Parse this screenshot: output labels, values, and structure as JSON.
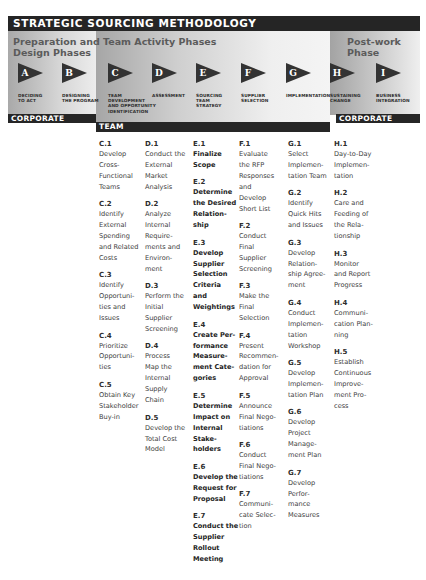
{
  "title": "STRATEGIC SOURCING METHODOLOGY",
  "colors": {
    "dark_bar": "#262626",
    "arrow": "#333333",
    "phase_title": "#5b5b5b",
    "panel_light": "#ececec",
    "panel_dark": "#a8a8a8"
  },
  "phases": {
    "preparation": {
      "title_line1": "Preparation and",
      "title_line2": "Design Phases",
      "bar_label": "CORPORATE"
    },
    "team": {
      "title": "Team Activity Phases",
      "bar_label": "TEAM"
    },
    "post": {
      "title_line1": "Post-work",
      "title_line2": "Phase",
      "bar_label": "CORPORATE"
    }
  },
  "steps": [
    {
      "letter": "A",
      "label_lines": [
        "Deciding",
        "to Act"
      ]
    },
    {
      "letter": "B",
      "label_lines": [
        "Designing",
        "the Program"
      ]
    },
    {
      "letter": "C",
      "label_lines": [
        "Team",
        "Development",
        "and Opportunity",
        "Identification"
      ]
    },
    {
      "letter": "D",
      "label_lines": [
        "Assessment"
      ]
    },
    {
      "letter": "E",
      "label_lines": [
        "Sourcing",
        "Team",
        "Strategy"
      ]
    },
    {
      "letter": "F",
      "label_lines": [
        "Supplier",
        "Selection"
      ]
    },
    {
      "letter": "G",
      "label_lines": [
        "Implementation"
      ]
    },
    {
      "letter": "H",
      "label_lines": [
        "Sustaining",
        "Change"
      ]
    },
    {
      "letter": "I",
      "label_lines": [
        "Business",
        "Integration"
      ]
    }
  ],
  "columns": {
    "C": [
      {
        "code": "C.1",
        "text": "Develop\nCross-\nFunctional\nTeams"
      },
      {
        "code": "C.2",
        "text": "Identify\nExternal\nSpending\nand Related\nCosts"
      },
      {
        "code": "C.3",
        "text": "Identify\nOpportuni-\nties and\nIssues"
      },
      {
        "code": "C.4",
        "text": "Prioritize\nOpportuni-\nties"
      },
      {
        "code": "C.5",
        "text": "Obtain Key\nStakeholder\nBuy-in"
      }
    ],
    "D": [
      {
        "code": "D.1",
        "text": "Conduct the\nExternal\nMarket\nAnalysis"
      },
      {
        "code": "D.2",
        "text": "Analyze\nInternal\nRequire-\nments and\nEnviron-\nment"
      },
      {
        "code": "D.3",
        "text": "Perform the\nInitial\nSupplier\nScreening"
      },
      {
        "code": "D.4",
        "text": "Process\nMap the\nInternal\nSupply\nChain"
      },
      {
        "code": "D.5",
        "text": "Develop the\nTotal Cost\nModel"
      }
    ],
    "E": [
      {
        "code": "E.1",
        "text": "Finalize\nScope"
      },
      {
        "code": "E.2",
        "text": "Determine\nthe Desired\nRelation-\nship"
      },
      {
        "code": "E.3",
        "text": "Develop\nSupplier\nSelection\nCriteria\nand\nWeightings"
      },
      {
        "code": "E.4",
        "text": "Create Per-\nformance\nMeasure-\nment Cate-\ngories"
      },
      {
        "code": "E.5",
        "text": "Determine\nImpact on\nInternal\nStake-\nholders"
      },
      {
        "code": "E.6",
        "text": "Develop the\nRequest for\nProposal"
      },
      {
        "code": "E.7",
        "text": "Conduct the\nSupplier\nRollout\nMeeting"
      }
    ],
    "F": [
      {
        "code": "F.1",
        "text": "Evaluate\nthe RFP\nResponses\nand\nDevelop\nShort List"
      },
      {
        "code": "F.2",
        "text": "Conduct\nFinal\nSupplier\nScreening"
      },
      {
        "code": "F.3",
        "text": "Make the\nFinal\nSelection"
      },
      {
        "code": "F.4",
        "text": "Present\nRecommen-\ndation for\nApproval"
      },
      {
        "code": "F.5",
        "text": "Announce\nFinal Nego-\ntiations"
      },
      {
        "code": "F.6",
        "text": "Conduct\nFinal Nego-\ntiations"
      },
      {
        "code": "F.7",
        "text": "Communi-\ncate Selec-\ntion"
      }
    ],
    "G": [
      {
        "code": "G.1",
        "text": "Select\nImplemen-\ntation Team"
      },
      {
        "code": "G.2",
        "text": "Identify\nQuick Hits\nand Issues"
      },
      {
        "code": "G.3",
        "text": "Develop\nRelation-\nship Agree-\nment"
      },
      {
        "code": "G.4",
        "text": "Conduct\nImplemen-\ntation\nWorkshop"
      },
      {
        "code": "G.5",
        "text": "Develop\nImplemen-\ntation Plan"
      },
      {
        "code": "G.6",
        "text": "Develop\nProject\nManage-\nment Plan"
      },
      {
        "code": "G.7",
        "text": "Develop\nPerfor-\nmance\nMeasures"
      }
    ],
    "H": [
      {
        "code": "H.1",
        "text": "Day-to-Day\nImplemen-\ntation"
      },
      {
        "code": "H.2",
        "text": "Care and\nFeeding of\nthe Rela-\ntionship"
      },
      {
        "code": "H.3",
        "text": "Monitor\nand Report\nProgress"
      },
      {
        "code": "H.4",
        "text": "Communi-\ncation Plan-\nning"
      },
      {
        "code": "H.5",
        "text": "Establish\nContinuous\nImprove-\nment Pro-\ncess"
      }
    ]
  }
}
